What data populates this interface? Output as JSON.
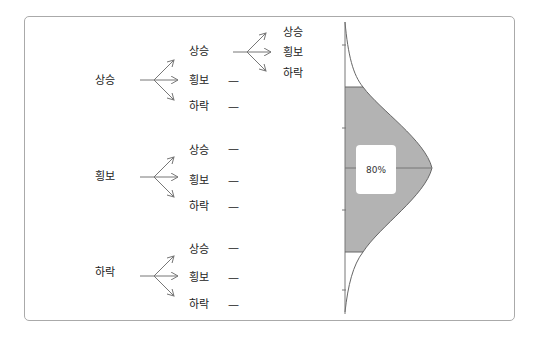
{
  "tree": {
    "roots": [
      {
        "label": "상승",
        "children": [
          {
            "label": "상승",
            "children": [
              "상승",
              "횡보",
              "하락"
            ]
          },
          {
            "label": "횡보",
            "dash": "—"
          },
          {
            "label": "하락",
            "dash": "—"
          }
        ]
      },
      {
        "label": "횡보",
        "children": [
          {
            "label": "상승",
            "dash": "—"
          },
          {
            "label": "횡보",
            "dash": "—"
          },
          {
            "label": "하락",
            "dash": "—"
          }
        ]
      },
      {
        "label": "하락",
        "children": [
          {
            "label": "상승",
            "dash": "—"
          },
          {
            "label": "횡보",
            "dash": "—"
          },
          {
            "label": "하락",
            "dash": "—"
          }
        ]
      }
    ],
    "deep": {
      "0": "상승",
      "1": "횡보",
      "2": "하락"
    }
  },
  "distribution": {
    "shaded_percent_label": "80%",
    "fill_color": "#b3b3b3",
    "line_color": "#666666"
  }
}
